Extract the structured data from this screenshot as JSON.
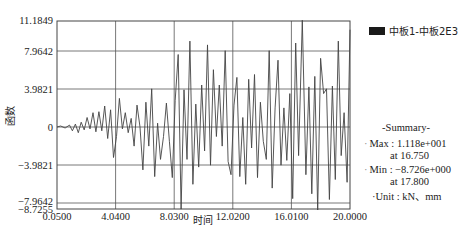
{
  "chart_data": {
    "type": "line",
    "title": "",
    "xlabel": "时间",
    "ylabel": "函数",
    "xlim": [
      0.05,
      20.0
    ],
    "ylim": [
      -8.7255,
      11.1849
    ],
    "x_ticks": [
      "0.0500",
      "4.0400",
      "8.0300",
      "12.0200",
      "16.0100",
      "20.0000"
    ],
    "y_ticks": [
      "11.1849",
      "7.9642",
      "3.9821",
      "0",
      "-3.9821",
      "-7.9642",
      "-8.7255"
    ],
    "grid": true,
    "legend_position": "right",
    "series": [
      {
        "name": "中板1-中板2E3",
        "color": "#444444",
        "x": [
          0.05,
          0.3,
          0.6,
          0.9,
          1.1,
          1.3,
          1.5,
          1.7,
          1.9,
          2.1,
          2.3,
          2.5,
          2.7,
          2.9,
          3.1,
          3.3,
          3.5,
          3.7,
          3.9,
          4.1,
          4.3,
          4.5,
          4.7,
          4.9,
          5.1,
          5.3,
          5.5,
          5.7,
          5.9,
          6.1,
          6.3,
          6.5,
          6.7,
          6.9,
          7.1,
          7.3,
          7.5,
          7.7,
          7.9,
          8.1,
          8.3,
          8.5,
          8.7,
          8.9,
          9.1,
          9.3,
          9.5,
          9.7,
          9.9,
          10.1,
          10.3,
          10.5,
          10.7,
          10.9,
          11.1,
          11.3,
          11.5,
          11.7,
          11.9,
          12.1,
          12.3,
          12.5,
          12.7,
          12.9,
          13.1,
          13.3,
          13.5,
          13.7,
          13.9,
          14.1,
          14.3,
          14.5,
          14.7,
          14.9,
          15.1,
          15.3,
          15.5,
          15.7,
          15.9,
          16.1,
          16.3,
          16.5,
          16.75,
          17.0,
          17.2,
          17.4,
          17.6,
          17.8,
          18.0,
          18.2,
          18.4,
          18.6,
          18.8,
          19.0,
          19.2,
          19.4,
          19.6,
          19.8,
          20.0
        ],
        "y": [
          0,
          0.1,
          -0.1,
          0.2,
          -0.4,
          0.3,
          -0.6,
          0.5,
          -0.3,
          1.0,
          -0.2,
          1.5,
          -0.5,
          1.6,
          -0.4,
          2.2,
          -1.2,
          1.8,
          -3.2,
          -1.0,
          3.0,
          -0.2,
          1.5,
          -0.6,
          0.9,
          -2.0,
          2.3,
          0.0,
          -4.5,
          2.6,
          -2.0,
          4.0,
          -5.2,
          0.4,
          -3.4,
          -1.0,
          2.5,
          -1.5,
          -5.3,
          2.8,
          7.6,
          -8.6,
          3.9,
          -3.4,
          9.0,
          -6.0,
          2.4,
          -4.2,
          4.4,
          -2.5,
          8.6,
          -4.0,
          6.0,
          -1.0,
          4.4,
          -2.0,
          8.0,
          -3.6,
          -5.0,
          2.3,
          5.2,
          -5.2,
          1.0,
          -6.0,
          5.0,
          -2.2,
          5.5,
          -5.3,
          2.6,
          -1.5,
          -3.4,
          8.0,
          -6.4,
          2.0,
          7.0,
          -4.0,
          2.0,
          -3.5,
          3.5,
          -7.5,
          8.8,
          -3.0,
          11.18,
          -5.0,
          4.2,
          -7.0,
          5.3,
          -8.7,
          7.2,
          3.5,
          4.0,
          -7.6,
          4.3,
          -5.5,
          9.0,
          -3.0,
          1.5,
          -5.8,
          10.2
        ]
      }
    ],
    "summary": {
      "title": "-Summary-",
      "max_label": "Max :",
      "max_value": "1.118e+001",
      "max_at_label": "at",
      "max_at": "16.750",
      "min_label": "Min :",
      "min_value": "−8.726e+000",
      "min_at_label": "at",
      "min_at": "17.800",
      "unit_label": "Unit :",
      "unit_value": "kN、mm"
    }
  }
}
